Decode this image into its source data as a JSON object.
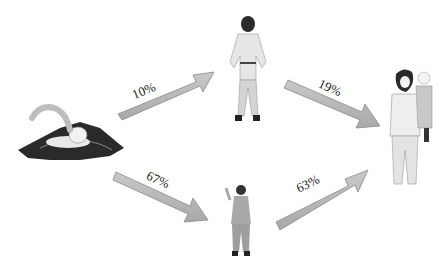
{
  "diagram": {
    "nodes": [
      {
        "id": "swimmer",
        "label": "swimmer-in-water"
      },
      {
        "id": "man",
        "label": "standing-man"
      },
      {
        "id": "child",
        "label": "standing-child"
      },
      {
        "id": "mother",
        "label": "woman-holding-child"
      }
    ],
    "edges": [
      {
        "from": "swimmer",
        "to": "man",
        "label": "10%"
      },
      {
        "from": "man",
        "to": "mother",
        "label": "19%"
      },
      {
        "from": "swimmer",
        "to": "child",
        "label": "67%"
      },
      {
        "from": "child",
        "to": "mother",
        "label": "63%"
      }
    ],
    "colors": {
      "arrow_fill": "#b8b8b8",
      "arrow_stroke": "#8a8a8a",
      "water": "#2a2a2a"
    }
  }
}
